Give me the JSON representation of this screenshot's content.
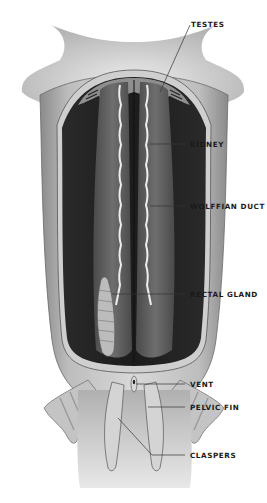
{
  "diagram": {
    "labels": [
      {
        "id": "testes",
        "text": "TESTES"
      },
      {
        "id": "kidney",
        "text": "KIDNEY"
      },
      {
        "id": "wolffian-duct",
        "text": "WOLFFIAN DUCT"
      },
      {
        "id": "rectal-gland",
        "text": "RECTAL GLAND"
      },
      {
        "id": "vent",
        "text": "VENT"
      },
      {
        "id": "pelvic-fin",
        "text": "PELVIC FIN"
      },
      {
        "id": "claspers",
        "text": "CLASPERS"
      }
    ],
    "colors": {
      "background": "#ffffff",
      "body_light": "#d9d9d9",
      "body_mid": "#9a9a9a",
      "cavity_dark": "#222222",
      "organ": "#5a5a5a",
      "duct": "#eeeeee",
      "leader_line": "#333333",
      "label_text": "#1a1a1a"
    }
  }
}
